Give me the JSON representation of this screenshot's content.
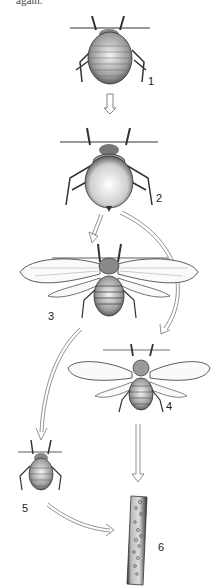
{
  "figure": {
    "top_text": "again.",
    "stages": [
      {
        "id": 1,
        "label": "1",
        "description": "wingless nymph"
      },
      {
        "id": 2,
        "label": "2",
        "description": "wingless adult"
      },
      {
        "id": 3,
        "label": "3",
        "description": "winged adult"
      },
      {
        "id": 4,
        "label": "4",
        "description": "winged adult (second form)"
      },
      {
        "id": 5,
        "label": "5",
        "description": "nymph"
      },
      {
        "id": 6,
        "label": "6",
        "description": "plant stem with eggs"
      }
    ],
    "arrows": [
      {
        "from": 1,
        "to": 2
      },
      {
        "from": 2,
        "to": 3
      },
      {
        "from": 2,
        "to": 4
      },
      {
        "from": 3,
        "to": 5
      },
      {
        "from": 4,
        "to": 6
      },
      {
        "from": 5,
        "to": 6
      }
    ]
  }
}
